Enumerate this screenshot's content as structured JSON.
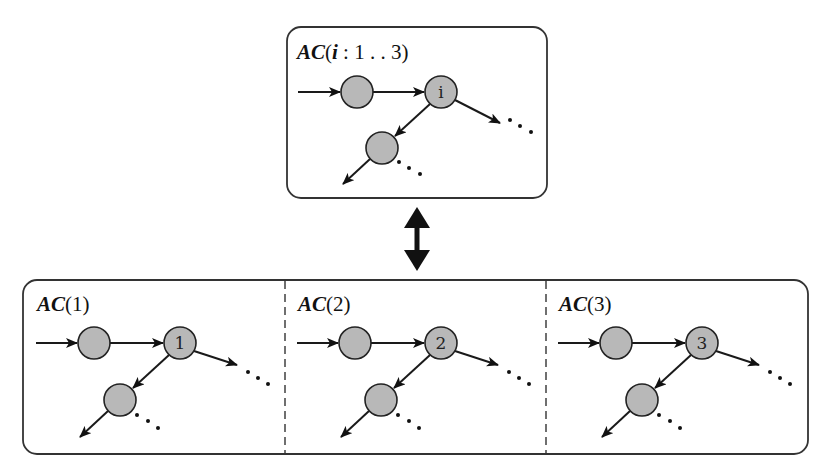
{
  "colors": {
    "node_fill": "#b8b8b8",
    "stroke": "#222222",
    "background": "#ffffff"
  },
  "top_panel": {
    "title": {
      "prefix": "AC",
      "open": "(",
      "var": "i",
      "range": " : 1 . . 3",
      "close": ")"
    },
    "node_label": "i"
  },
  "relation_arrow": {
    "icon": "double-headed-vertical-arrow-icon"
  },
  "bottom_panels": [
    {
      "title": {
        "prefix": "AC",
        "arg": "(1)"
      },
      "node_label": "1"
    },
    {
      "title": {
        "prefix": "AC",
        "arg": "(2)"
      },
      "node_label": "2"
    },
    {
      "title": {
        "prefix": "AC",
        "arg": "(3)"
      },
      "node_label": "3"
    }
  ],
  "ellipsis": "…"
}
